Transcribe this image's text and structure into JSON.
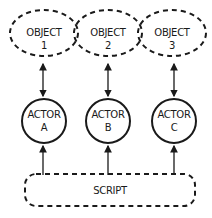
{
  "diagram": {
    "objects": [
      {
        "line1": "OBJECT",
        "line2": "1"
      },
      {
        "line1": "OBJECT",
        "line2": "2"
      },
      {
        "line1": "OBJECT",
        "line2": "3"
      }
    ],
    "actors": [
      {
        "line1": "ACTOR",
        "line2": "A"
      },
      {
        "line1": "ACTOR",
        "line2": "B"
      },
      {
        "line1": "ACTOR",
        "line2": "C"
      }
    ],
    "script": {
      "label": "SCRIPT"
    },
    "connections": [
      {
        "from": "OBJECT 1",
        "to": "ACTOR A",
        "type": "bidirectional"
      },
      {
        "from": "OBJECT 2",
        "to": "ACTOR B",
        "type": "bidirectional"
      },
      {
        "from": "OBJECT 3",
        "to": "ACTOR C",
        "type": "bidirectional"
      },
      {
        "from": "SCRIPT",
        "to": "ACTOR A",
        "type": "directed"
      },
      {
        "from": "SCRIPT",
        "to": "ACTOR B",
        "type": "directed"
      },
      {
        "from": "SCRIPT",
        "to": "ACTOR C",
        "type": "directed"
      }
    ],
    "colors": {
      "stroke": "#1a1a1a",
      "background": "#ffffff"
    }
  }
}
